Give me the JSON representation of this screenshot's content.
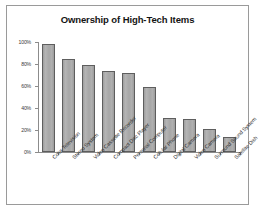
{
  "chart_data": {
    "type": "bar",
    "title": "Ownership of High-Tech Items",
    "xlabel": "",
    "ylabel": "",
    "ylim": [
      0,
      100
    ],
    "yticks": [
      "0%",
      "20%",
      "40%",
      "60%",
      "80%",
      "100%"
    ],
    "ytick_values": [
      0,
      20,
      40,
      60,
      80,
      100
    ],
    "grid": false,
    "legend": false,
    "categories": [
      "Color Television",
      "Stereo System",
      "Video Cassette Recorder",
      "Compact Disc Player",
      "Personal Computer",
      "Cellular Phone",
      "Digital Camera",
      "Video Camera",
      "Surround Sound System",
      "Satellite Dish"
    ],
    "values": [
      98,
      85,
      79,
      74,
      72,
      59,
      31,
      30,
      21,
      14
    ],
    "bar_color": "#a9a9a9",
    "bar_edge_color": "#5e5e5e",
    "axis_color": "#8c8c8c",
    "title_color": "#141414",
    "background": "#ffffff",
    "frame_color": "#9a9a9a"
  }
}
